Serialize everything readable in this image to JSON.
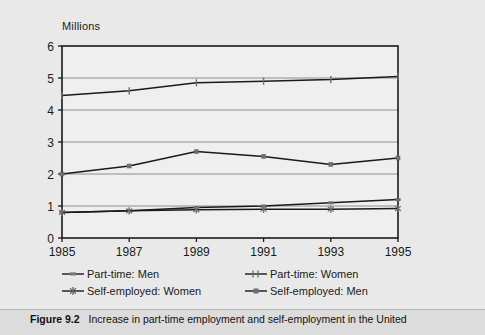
{
  "figure": {
    "caption_label": "Figure 9.2",
    "caption_text": "Increase in part-time employment and self-employment in the United"
  },
  "chart": {
    "axis_title": "Millions",
    "colors": {
      "background": "#e9e9e9",
      "plot_background": "#efefef",
      "gridline": "#8d8d8d",
      "frame": "#1a1a1a",
      "series_line": "#1a1a1a",
      "marker": "#6e6e6e",
      "caption_bar": "#dcdcdc"
    }
  },
  "chart_data": {
    "type": "line",
    "title": "",
    "subtitle": "",
    "xlabel": "",
    "ylabel": "Millions",
    "categories": [
      "1985",
      "1987",
      "1989",
      "1991",
      "1993",
      "1995"
    ],
    "x": [
      1985,
      1987,
      1989,
      1991,
      1993,
      1995
    ],
    "xlim": [
      1985,
      1995
    ],
    "ylim": [
      0,
      6
    ],
    "ytick_labels": [
      "0",
      "1",
      "2",
      "3",
      "4",
      "5",
      "6"
    ],
    "yticks": [
      0,
      1,
      2,
      3,
      4,
      5,
      6
    ],
    "grid": true,
    "grid_axis": "y",
    "legend_position": "below",
    "series": [
      {
        "name": "Part-time: Men",
        "values": [
          0.8,
          0.85,
          0.95,
          1.0,
          1.1,
          1.2
        ],
        "marker": "dash"
      },
      {
        "name": "Part-time: Women",
        "values": [
          4.45,
          4.6,
          4.85,
          4.9,
          4.95,
          5.05
        ],
        "marker": "plus"
      },
      {
        "name": "Self-employed: Women",
        "values": [
          0.8,
          0.85,
          0.88,
          0.9,
          0.9,
          0.92
        ],
        "marker": "star"
      },
      {
        "name": "Self-employed: Men",
        "values": [
          2.0,
          2.25,
          2.7,
          2.55,
          2.3,
          2.5
        ],
        "marker": "square"
      }
    ]
  }
}
